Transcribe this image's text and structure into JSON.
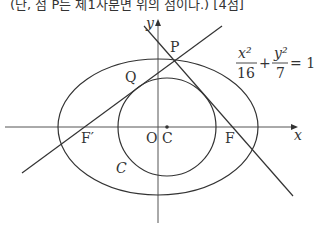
{
  "header": {
    "text": "(단, 점 P는 제1사분면 위의 점이다.) [4점]"
  },
  "labels": {
    "y_axis": "y",
    "x_axis": "x",
    "P": "P",
    "Q": "Q",
    "F_prime": "F′",
    "F": "F",
    "O": "O",
    "C_point": "C",
    "C_circle": "C"
  },
  "equation": {
    "num1": "x²",
    "den1": "16",
    "plus": "+",
    "num2": "y²",
    "den2": "7",
    "rhs": "= 1"
  },
  "colors": {
    "stroke": "#333333"
  }
}
